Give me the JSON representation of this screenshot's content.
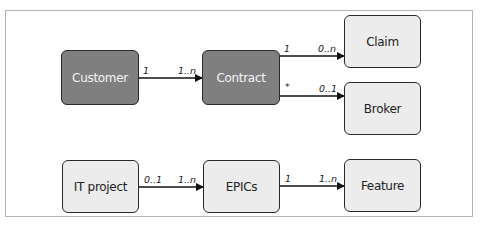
{
  "diagram": {
    "type": "entity-relationship",
    "colors": {
      "dark_fill": "#7f7f7f",
      "light_fill": "#ececec",
      "border": "#2a2a2a",
      "frame": "#b4b4b4"
    },
    "nodes": {
      "customer": {
        "label": "Customer",
        "style": "dark"
      },
      "contract": {
        "label": "Contract",
        "style": "dark"
      },
      "claim": {
        "label": "Claim",
        "style": "light"
      },
      "broker": {
        "label": "Broker",
        "style": "light"
      },
      "it_project": {
        "label": "IT project",
        "style": "light"
      },
      "epics": {
        "label": "EPICs",
        "style": "light"
      },
      "feature": {
        "label": "Feature",
        "style": "light"
      }
    },
    "edges": {
      "customer_contract": {
        "from": "Customer",
        "to": "Contract",
        "source_mult": "1",
        "target_mult": "1..n"
      },
      "contract_claim": {
        "from": "Contract",
        "to": "Claim",
        "source_mult": "1",
        "target_mult": "0..n"
      },
      "contract_broker": {
        "from": "Contract",
        "to": "Broker",
        "source_mult": "*",
        "target_mult": "0..1"
      },
      "itproject_epics": {
        "from": "IT project",
        "to": "EPICs",
        "source_mult": "0..1",
        "target_mult": "1..n"
      },
      "epics_feature": {
        "from": "EPICs",
        "to": "Feature",
        "source_mult": "1",
        "target_mult": "1..n"
      }
    }
  }
}
